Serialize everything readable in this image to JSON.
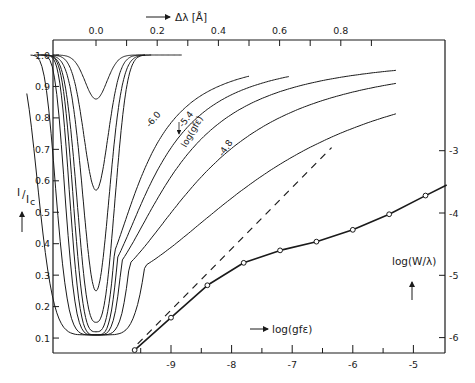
{
  "chart_data": [
    {
      "type": "line",
      "title": "Line profiles I/I_c vs Δλ for increasing log(gfε)",
      "xlabel": "Δλ [Å]",
      "ylabel": "I/I_c",
      "x_axis_position": "top",
      "xlim": [
        -0.3,
        0.98
      ],
      "ylim": [
        0.05,
        1.05
      ],
      "xticks": [
        0.0,
        0.2,
        0.4,
        0.6,
        0.8
      ],
      "xtick_labels": [
        "0.0",
        "0.2",
        "0.4",
        "0.6",
        "0.8"
      ],
      "xminor_ticks": [
        0.1,
        0.3,
        0.5,
        0.7,
        0.9
      ],
      "yticks": [
        0.1,
        0.2,
        0.3,
        0.4,
        0.5,
        0.6,
        0.7,
        0.8,
        0.9,
        1.0
      ],
      "ytick_labels": [
        "0.1",
        "0.2",
        "0.3",
        "0.4",
        "0.5",
        "0.6",
        "0.7",
        "0.8",
        "0.9",
        "1.0"
      ],
      "grid": false,
      "series": [
        {
          "name": "profile 1 (weakest)",
          "central_depth": 0.86,
          "half_width": 0.05,
          "wing_extent": 0.16
        },
        {
          "name": "profile 2",
          "central_depth": 0.57,
          "half_width": 0.055,
          "wing_extent": 0.16
        },
        {
          "name": "profile 3",
          "central_depth": 0.25,
          "half_width": 0.06,
          "wing_extent": 0.18
        },
        {
          "name": "profile 4",
          "central_depth": 0.15,
          "half_width": 0.075,
          "wing_extent": 0.28
        },
        {
          "name": "profile 5",
          "central_depth": 0.12,
          "half_width": 0.085,
          "wing_extent": 0.5
        },
        {
          "name": "profile 6",
          "central_depth": 0.11,
          "half_width": 0.095,
          "wing_extent": 0.63
        },
        {
          "name": "log(gfε) = -6.0",
          "central_depth": 0.11,
          "half_width": 0.11,
          "wing_extent": 0.98
        },
        {
          "name": "log(gfε) = -5.4",
          "central_depth": 0.11,
          "half_width": 0.14,
          "wing_extent": 0.98
        },
        {
          "name": "log(gfε) = -4.8",
          "central_depth": 0.11,
          "half_width": 0.2,
          "wing_extent": 0.98
        }
      ],
      "annotations": [
        "-6.0",
        "-5.4",
        "log(gfε)",
        "-4.8"
      ]
    },
    {
      "type": "line",
      "title": "Curve of growth",
      "xlabel": "log(gfε)",
      "ylabel": "log(W/λ)",
      "y_axis_position": "right",
      "xlim": [
        -10.1,
        -4.5
      ],
      "ylim": [
        -6.25,
        -2.3
      ],
      "xticks": [
        -9,
        -8,
        -7,
        -6,
        -5
      ],
      "xtick_labels": [
        "-9",
        "-8",
        "-7",
        "-6",
        "-5"
      ],
      "xminor_ticks": [
        -9.5,
        -8.5,
        -7.5,
        -6.5,
        -5.5
      ],
      "yticks": [
        -6,
        -5,
        -4,
        -3
      ],
      "ytick_labels": [
        "-6",
        "-5",
        "-4",
        "-3"
      ],
      "grid": false,
      "series": [
        {
          "name": "curve of growth",
          "style": "solid with open circles",
          "x": [
            -9.6,
            -9.0,
            -8.4,
            -7.8,
            -7.2,
            -6.6,
            -6.0,
            -5.4,
            -4.8
          ],
          "y": [
            -6.2,
            -5.68,
            -5.16,
            -4.8,
            -4.6,
            -4.46,
            -4.27,
            -4.02,
            -3.72
          ]
        },
        {
          "name": "linear part (slope 1)",
          "style": "dashed",
          "x": [
            -9.55,
            -6.35
          ],
          "y": [
            -6.1,
            -2.95
          ]
        }
      ]
    }
  ],
  "labels": {
    "top_axis_title": "Δλ [Å]",
    "left_axis_title_main": "I",
    "left_axis_title_sub": "I",
    "left_axis_title_subscript": "c",
    "bottom_axis_title": "log(gfε)",
    "right_axis_title": "log(W/λ)",
    "label_m60": "-6.0",
    "label_m54": "-5.4",
    "label_loggfe": "log(gfε)",
    "label_m48": "-4.8"
  }
}
